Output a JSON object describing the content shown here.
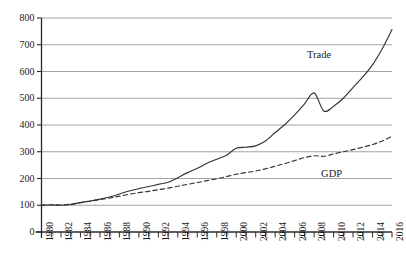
{
  "chart_data": {
    "type": "line",
    "title": "",
    "subtitle": "",
    "xlabel": "",
    "ylabel": "",
    "xlim": [
      1980,
      2016
    ],
    "ylim": [
      0,
      800
    ],
    "y_ticks": [
      0,
      100,
      200,
      300,
      400,
      500,
      600,
      700,
      800
    ],
    "y_tick_labels": [
      "0",
      "100",
      "200",
      "300",
      "400",
      "500",
      "600",
      "700",
      "800"
    ],
    "x_ticks": [
      1980,
      1981,
      1982,
      1983,
      1984,
      1985,
      1986,
      1987,
      1988,
      1989,
      1990,
      1991,
      1992,
      1993,
      1994,
      1995,
      1996,
      1997,
      1998,
      1999,
      2000,
      2001,
      2002,
      2003,
      2004,
      2005,
      2006,
      2007,
      2008,
      2009,
      2010,
      2011,
      2012,
      2013,
      2014,
      2015,
      2016
    ],
    "x_tick_labels": [
      "1980",
      "",
      "1982",
      "",
      "1984",
      "",
      "1986",
      "",
      "1988",
      "",
      "1990",
      "",
      "1992",
      "",
      "1994",
      "",
      "1996",
      "",
      "1998",
      "",
      "2000",
      "",
      "2002",
      "",
      "2004",
      "",
      "2006",
      "",
      "2008",
      "",
      "2010",
      "",
      "2012",
      "",
      "2014",
      "",
      "2016"
    ],
    "grid": "horizontal",
    "legend_position": "inline",
    "series": [
      {
        "name": "Trade",
        "style": "solid",
        "color": "#333333",
        "label_x": 2012,
        "label_y": 660,
        "x": [
          1980,
          1981,
          1982,
          1983,
          1984,
          1985,
          1986,
          1987,
          1988,
          1989,
          1990,
          1991,
          1992,
          1993,
          1994,
          1995,
          1996,
          1997,
          1998,
          1999,
          2000,
          2001,
          2002,
          2003,
          2004,
          2005,
          2006,
          2007,
          2008,
          2009,
          2010,
          2011,
          2012,
          2013,
          2014,
          2015,
          2016
        ],
        "values": [
          100,
          101,
          100,
          103,
          110,
          116,
          123,
          131,
          142,
          153,
          162,
          170,
          178,
          186,
          203,
          222,
          238,
          257,
          272,
          287,
          313,
          317,
          322,
          340,
          372,
          402,
          438,
          478,
          520,
          452,
          470,
          500,
          540,
          580,
          625,
          685,
          757
        ]
      },
      {
        "name": "GDP",
        "style": "dashed",
        "color": "#333333",
        "label_x": 2012,
        "label_y": 218,
        "x": [
          1980,
          1981,
          1982,
          1983,
          1984,
          1985,
          1986,
          1987,
          1988,
          1989,
          1990,
          1991,
          1992,
          1993,
          1994,
          1995,
          1996,
          1997,
          1998,
          1999,
          2000,
          2001,
          2002,
          2003,
          2004,
          2005,
          2006,
          2007,
          2008,
          2009,
          2010,
          2011,
          2012,
          2013,
          2014,
          2015,
          2016
        ],
        "values": [
          100,
          102,
          101,
          104,
          110,
          115,
          121,
          127,
          134,
          141,
          147,
          152,
          158,
          164,
          171,
          178,
          185,
          192,
          199,
          207,
          216,
          222,
          228,
          236,
          246,
          256,
          267,
          278,
          285,
          283,
          292,
          300,
          308,
          317,
          327,
          340,
          358
        ]
      }
    ]
  },
  "axes": {
    "trade_label": "Trade",
    "gdp_label": "GDP"
  }
}
